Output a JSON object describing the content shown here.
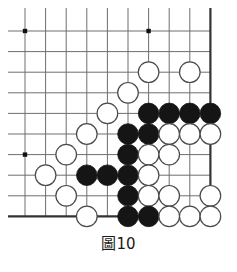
{
  "figure": {
    "caption": "圖10",
    "caption_label": "圖",
    "caption_number": "10",
    "kind": "go-board-diagram"
  },
  "board": {
    "title": "Go board corner diagram",
    "orientation": "upper-left-corner",
    "cols": 10,
    "rows": 10,
    "x_positions": [
      25,
      45.6,
      66.2,
      86.8,
      107.4,
      128,
      148.6,
      169.2,
      189.8,
      210.4
    ],
    "y_positions": [
      31,
      51.6,
      72.2,
      92.8,
      113.4,
      134,
      154.6,
      175.2,
      195.8,
      216.4
    ],
    "stone_radius": 10.3,
    "line_color": "#6e6e6e",
    "edge_color": "#333333",
    "black_color": "#151515",
    "white_fill": "#ffffff",
    "white_stroke": "#4a4a4a",
    "background": "#ffffff",
    "star_points": [
      {
        "col": 0,
        "row": 0
      },
      {
        "col": 6,
        "row": 0
      },
      {
        "col": 0,
        "row": 6
      }
    ],
    "edges": {
      "top": false,
      "left": false,
      "right": true,
      "bottom": true
    },
    "stones": [
      {
        "col": 6,
        "row": 2,
        "color": "white"
      },
      {
        "col": 8,
        "row": 2,
        "color": "white"
      },
      {
        "col": 5,
        "row": 3,
        "color": "white"
      },
      {
        "col": 4,
        "row": 4,
        "color": "white"
      },
      {
        "col": 6,
        "row": 4,
        "color": "black"
      },
      {
        "col": 7,
        "row": 4,
        "color": "black"
      },
      {
        "col": 8,
        "row": 4,
        "color": "black"
      },
      {
        "col": 9,
        "row": 4,
        "color": "black"
      },
      {
        "col": 3,
        "row": 5,
        "color": "white"
      },
      {
        "col": 5,
        "row": 5,
        "color": "black"
      },
      {
        "col": 6,
        "row": 5,
        "color": "black"
      },
      {
        "col": 7,
        "row": 5,
        "color": "white"
      },
      {
        "col": 8,
        "row": 5,
        "color": "white"
      },
      {
        "col": 9,
        "row": 5,
        "color": "white"
      },
      {
        "col": 2,
        "row": 6,
        "color": "white"
      },
      {
        "col": 5,
        "row": 6,
        "color": "black"
      },
      {
        "col": 6,
        "row": 6,
        "color": "white"
      },
      {
        "col": 7,
        "row": 6,
        "color": "white"
      },
      {
        "col": 1,
        "row": 7,
        "color": "white"
      },
      {
        "col": 3,
        "row": 7,
        "color": "black"
      },
      {
        "col": 4,
        "row": 7,
        "color": "black"
      },
      {
        "col": 5,
        "row": 7,
        "color": "black"
      },
      {
        "col": 6,
        "row": 7,
        "color": "white"
      },
      {
        "col": 2,
        "row": 8,
        "color": "white"
      },
      {
        "col": 5,
        "row": 8,
        "color": "black"
      },
      {
        "col": 6,
        "row": 8,
        "color": "white"
      },
      {
        "col": 7,
        "row": 8,
        "color": "white"
      },
      {
        "col": 9,
        "row": 8,
        "color": "white"
      },
      {
        "col": 3,
        "row": 9,
        "color": "white"
      },
      {
        "col": 5,
        "row": 9,
        "color": "black"
      },
      {
        "col": 6,
        "row": 9,
        "color": "black"
      },
      {
        "col": 7,
        "row": 9,
        "color": "white"
      },
      {
        "col": 8,
        "row": 9,
        "color": "white"
      },
      {
        "col": 9,
        "row": 9,
        "color": "white"
      }
    ]
  }
}
